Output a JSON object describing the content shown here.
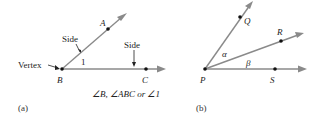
{
  "figure_a": {
    "caption": "(a)",
    "points": {
      "A": "A",
      "B": "B",
      "C": "C"
    },
    "side_labels": [
      "Side",
      "Side"
    ],
    "vertex_label": "Vertex",
    "angle_number": "1",
    "notation": "∠B, ∠ABC or ∠1"
  },
  "figure_b": {
    "caption": "(b)",
    "points": {
      "P": "P",
      "Q": "Q",
      "R": "R",
      "S": "S"
    },
    "angles": {
      "alpha": "α",
      "beta": "β"
    }
  },
  "colors": {
    "ray": "#8a8a8a",
    "point": "#111111",
    "text": "#222222"
  }
}
